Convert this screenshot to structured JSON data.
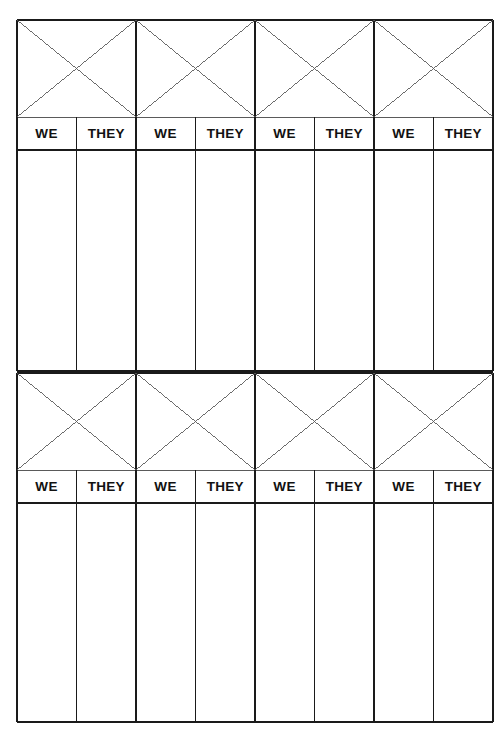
{
  "document": {
    "title": "We / They Score Sheet",
    "type": "tally-score-sheet",
    "page_width": 503,
    "page_height": 741,
    "background_color": "#ffffff",
    "line_color": "#1a1a1a",
    "thin_line_color": "#5a5a5a",
    "text_color": "#111111"
  },
  "geometry": {
    "left": 17,
    "right": 493,
    "column_count": 8,
    "pair_count": 4,
    "sections": [
      {
        "x_area_top": 20,
        "x_area_bottom": 117,
        "label_row_top": 117,
        "label_row_bottom": 150,
        "body_top": 150,
        "body_bottom": 371
      },
      {
        "x_area_top": 373,
        "x_area_bottom": 470,
        "label_row_top": 470,
        "label_row_bottom": 503,
        "body_top": 503,
        "body_bottom": 722
      }
    ]
  },
  "sections": [
    {
      "name": "upper-score-section",
      "header_labels": [
        "WE",
        "THEY",
        "WE",
        "THEY",
        "WE",
        "THEY",
        "WE",
        "THEY"
      ],
      "write_cells": [
        "",
        "",
        "",
        "",
        "",
        "",
        "",
        ""
      ]
    },
    {
      "name": "lower-score-section",
      "header_labels": [
        "WE",
        "THEY",
        "WE",
        "THEY",
        "WE",
        "THEY",
        "WE",
        "THEY"
      ],
      "write_cells": [
        "",
        "",
        "",
        "",
        "",
        "",
        "",
        ""
      ]
    }
  ]
}
